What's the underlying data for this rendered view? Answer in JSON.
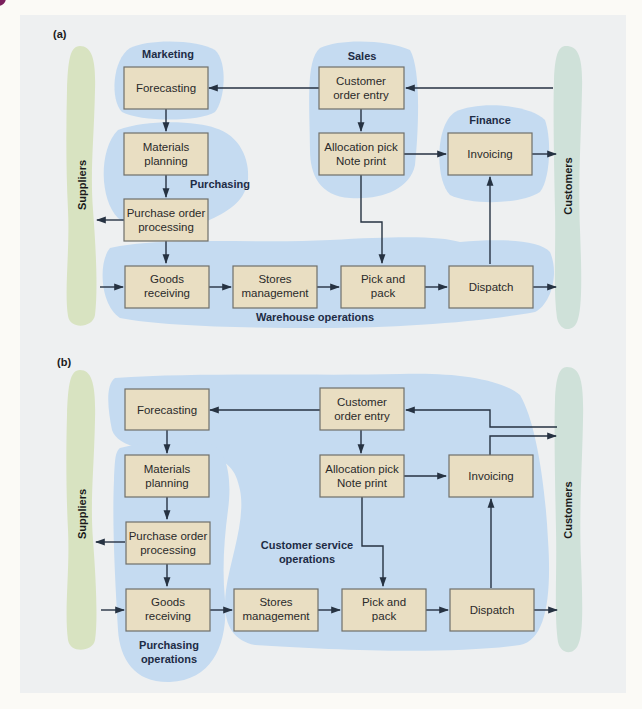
{
  "colors": {
    "box_fill": "#e9dec2",
    "blob_blue": "#c5dbf1",
    "suppliers_bar": "#d8e3c1",
    "customers_bar": "#cfe1d9",
    "panel_bg": "#eef0f1",
    "line": "#263242",
    "label_text": "#1d2c45"
  },
  "diagram_a": {
    "panel_label": "(a)",
    "side_bars": {
      "left": "Suppliers",
      "right": "Customers"
    },
    "group_labels": {
      "marketing": "Marketing",
      "sales": "Sales",
      "finance": "Finance",
      "purchasing": "Purchasing",
      "warehouse": "Warehouse operations"
    },
    "boxes": {
      "forecasting": [
        "Forecasting"
      ],
      "customer_order_entry": [
        "Customer",
        "order entry"
      ],
      "materials_planning": [
        "Materials",
        "planning"
      ],
      "allocation": [
        "Allocation pick",
        "Note print"
      ],
      "invoicing": [
        "Invoicing"
      ],
      "purchase_order": [
        "Purchase order",
        "processing"
      ],
      "goods_receiving": [
        "Goods",
        "receiving"
      ],
      "stores": [
        "Stores",
        "management"
      ],
      "pick_pack": [
        "Pick and",
        "pack"
      ],
      "dispatch": [
        "Dispatch"
      ]
    }
  },
  "diagram_b": {
    "panel_label": "(b)",
    "side_bars": {
      "left": "Suppliers",
      "right": "Customers"
    },
    "group_labels": {
      "customer_service": [
        "Customer service",
        "operations"
      ],
      "purchasing": [
        "Purchasing",
        "operations"
      ]
    },
    "boxes": {
      "forecasting": [
        "Forecasting"
      ],
      "customer_order_entry": [
        "Customer",
        "order entry"
      ],
      "materials_planning": [
        "Materials",
        "planning"
      ],
      "allocation": [
        "Allocation pick",
        "Note print"
      ],
      "invoicing": [
        "Invoicing"
      ],
      "purchase_order": [
        "Purchase order",
        "processing"
      ],
      "goods_receiving": [
        "Goods",
        "receiving"
      ],
      "stores": [
        "Stores",
        "management"
      ],
      "pick_pack": [
        "Pick and",
        "pack"
      ],
      "dispatch": [
        "Dispatch"
      ]
    }
  }
}
